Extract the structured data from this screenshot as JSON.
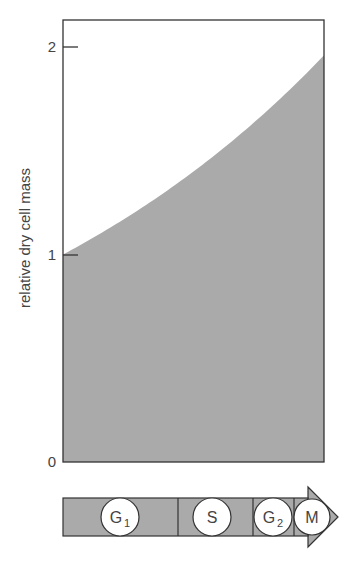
{
  "chart_data": {
    "type": "area",
    "title": "",
    "xlabel": "",
    "ylabel": "relative dry cell mass",
    "ylim": [
      0,
      2.2
    ],
    "yticks": [
      0,
      1,
      2
    ],
    "ytick_labels": [
      "0",
      "1",
      "2"
    ],
    "grid": false,
    "legend": null,
    "x": [
      0,
      0.125,
      0.25,
      0.375,
      0.5,
      0.625,
      0.75,
      0.875,
      1.0
    ],
    "series": [
      {
        "name": "relative dry cell mass",
        "values": [
          1.0,
          1.09,
          1.18,
          1.29,
          1.39,
          1.52,
          1.65,
          1.8,
          1.96
        ],
        "fill": "#aaaaaa"
      }
    ],
    "annotations": "Exponential growth of cell mass from 1 to ~2 over one cell cycle"
  },
  "axis": {
    "ylabel": "relative dry cell mass",
    "ticks": [
      {
        "label": "0",
        "value": 0
      },
      {
        "label": "1",
        "value": 1
      },
      {
        "label": "2",
        "value": 2
      }
    ]
  },
  "cell_cycle": {
    "phases": [
      {
        "name": "G",
        "sub": "1",
        "start": 0.0,
        "end": 0.44
      },
      {
        "name": "S",
        "sub": "",
        "start": 0.44,
        "end": 0.73
      },
      {
        "name": "G",
        "sub": "2",
        "start": 0.73,
        "end": 0.89
      },
      {
        "name": "M",
        "sub": "",
        "start": 0.89,
        "end": 1.0
      }
    ]
  },
  "colors": {
    "fill": "#aaaaaa",
    "stroke": "#333333",
    "circle_fill": "#ffffff"
  }
}
